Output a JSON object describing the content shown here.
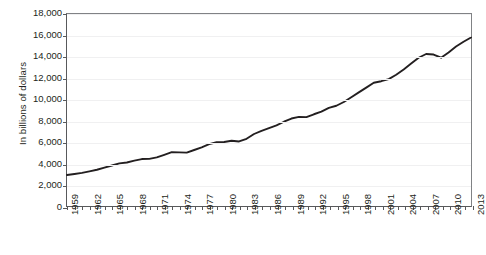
{
  "chart_data": {
    "type": "line",
    "title": "",
    "xlabel": "",
    "ylabel": "In billions of dollars",
    "xlim": [
      1959,
      2013
    ],
    "ylim": [
      0,
      18000
    ],
    "grid": true,
    "legend": false,
    "y_ticks": [
      {
        "value": 18000,
        "label": "18,000"
      },
      {
        "value": 16000,
        "label": "16,000"
      },
      {
        "value": 14000,
        "label": "14,000"
      },
      {
        "value": 12000,
        "label": "12,000"
      },
      {
        "value": 10000,
        "label": "10,000"
      },
      {
        "value": 8000,
        "label": "8,000"
      },
      {
        "value": 6000,
        "label": "6,000"
      },
      {
        "value": 4000,
        "label": "4,000"
      },
      {
        "value": 2000,
        "label": "2,000"
      },
      {
        "value": 0,
        "label": "0"
      }
    ],
    "x_tick_labels": [
      "1959",
      "1962",
      "1965",
      "1968",
      "1971",
      "1974",
      "1977",
      "1980",
      "1983",
      "1986",
      "1989",
      "1992",
      "1995",
      "1998",
      "2001",
      "2004",
      "2007",
      "2010",
      "2013"
    ],
    "x_tick_step": 3,
    "series": [
      {
        "name": "In billions of dollars",
        "color": "#231f20",
        "x": [
          1959,
          1960,
          1961,
          1962,
          1963,
          1964,
          1965,
          1966,
          1967,
          1968,
          1969,
          1970,
          1971,
          1972,
          1973,
          1974,
          1975,
          1976,
          1977,
          1978,
          1979,
          1980,
          1981,
          1982,
          1983,
          1984,
          1985,
          1986,
          1987,
          1988,
          1989,
          1990,
          1991,
          1992,
          1993,
          1994,
          1995,
          1996,
          1997,
          1998,
          1999,
          2000,
          2001,
          2002,
          2003,
          2004,
          2005,
          2006,
          2007,
          2008,
          2009,
          2010,
          2011,
          2012,
          2013
        ],
        "values": [
          2900,
          3000,
          3100,
          3250,
          3400,
          3600,
          3800,
          4000,
          4080,
          4250,
          4400,
          4420,
          4560,
          4800,
          5050,
          5030,
          5000,
          5250,
          5500,
          5800,
          5980,
          6000,
          6120,
          6050,
          6300,
          6750,
          7050,
          7300,
          7550,
          7900,
          8200,
          8350,
          8330,
          8600,
          8850,
          9200,
          9400,
          9750,
          10200,
          10650,
          11100,
          11550,
          11700,
          11900,
          12300,
          12800,
          13350,
          13900,
          14250,
          14200,
          13900,
          14400,
          14950,
          15400,
          15800
        ]
      }
    ]
  }
}
